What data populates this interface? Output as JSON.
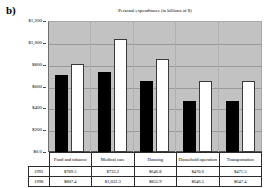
{
  "panel_label": "b)",
  "chart_data": {
    "type": "bar",
    "title": "Personal expenditures (in billions of $)",
    "xlabel": "",
    "ylabel": "",
    "ylim": [
      0,
      1200
    ],
    "ytick_labels": [
      "$1,200",
      "$1,000",
      "$800",
      "$600",
      "$400",
      "$200",
      "$0.0"
    ],
    "ytick_values": [
      1200,
      1000,
      800,
      600,
      400,
      200,
      0
    ],
    "grid": true,
    "legend_position": "none",
    "categories": [
      "Food and tobacco",
      "Medical care",
      "Housing",
      "Household operation",
      "Transportation"
    ],
    "series": [
      {
        "name": "1992",
        "color": "#000000",
        "values": [
          709.5,
          733.2,
          646.8,
          470.6,
          471.5
        ],
        "labels": [
          "$709.5",
          "$733.2",
          "$646.8",
          "$470.6",
          "$471.5"
        ]
      },
      {
        "name": "1998",
        "color": "#ffffff",
        "values": [
          807.4,
          1032.3,
          855.9,
          646.5,
          647.4
        ],
        "labels": [
          "$807.4",
          "$1,032.3",
          "$855.9",
          "$646.5",
          "$647.4"
        ]
      }
    ],
    "plot_background": "#c2c2c2"
  },
  "table": {
    "corner": "",
    "column_headers": [
      "Food and tobacco",
      "Medical care",
      "Housing",
      "Household operation",
      "Transportation"
    ],
    "rows": [
      {
        "label": "1992",
        "cells": [
          "$709.5",
          "$733.2",
          "$646.8",
          "$470.6",
          "$471.5"
        ]
      },
      {
        "label": "1998",
        "cells": [
          "$807.4",
          "$1,032.3",
          "$855.9",
          "$646.5",
          "$647.4"
        ]
      }
    ]
  }
}
